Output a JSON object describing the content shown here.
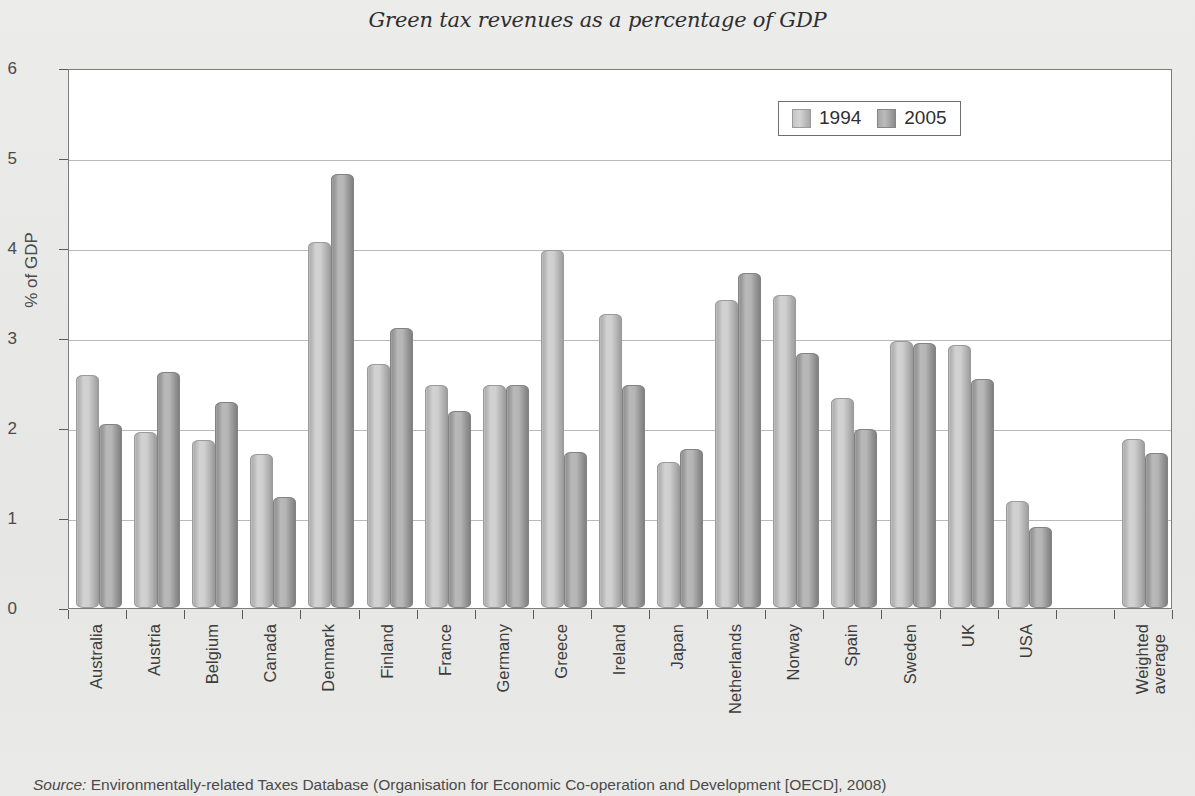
{
  "title": "Green tax revenues as a percentage of GDP",
  "source": {
    "keyword": "Source:",
    "text": " Environmentally-related Taxes Database (Organisation for Economic Co-operation and Development [OECD], 2008)"
  },
  "legend": {
    "items": [
      {
        "label": "1994",
        "color": "#c9c9c9"
      },
      {
        "label": "2005",
        "color": "#ababab"
      }
    ]
  },
  "chart_data": {
    "type": "bar",
    "title": "Green tax revenues as a percentage of GDP",
    "xlabel": "",
    "ylabel": "% of GDP",
    "ylim": [
      0,
      6
    ],
    "ytick_labels": [
      "6",
      "5",
      "4",
      "3",
      "2",
      "1",
      "0"
    ],
    "ytick_values": [
      6,
      5,
      4,
      3,
      2,
      1,
      0
    ],
    "grid": true,
    "legend_position": "top-right",
    "categories": [
      "Australia",
      "Austria",
      "Belgium",
      "Canada",
      "Denmark",
      "Finland",
      "France",
      "Germany",
      "Greece",
      "Ireland",
      "Japan",
      "Netherlands",
      "Norway",
      "Spain",
      "Sweden",
      "UK",
      "USA",
      "Weighted average"
    ],
    "series": [
      {
        "name": "1994",
        "values": [
          2.57,
          1.93,
          1.85,
          1.69,
          4.05,
          2.69,
          2.46,
          2.46,
          3.96,
          3.25,
          1.6,
          3.4,
          3.46,
          2.31,
          2.94,
          2.9,
          1.17,
          1.86
        ]
      },
      {
        "name": "2005",
        "values": [
          2.02,
          2.6,
          2.27,
          1.21,
          4.8,
          3.09,
          2.17,
          2.46,
          1.71,
          2.46,
          1.75,
          3.7,
          2.81,
          1.97,
          2.92,
          2.52,
          0.88,
          1.7
        ]
      }
    ]
  }
}
